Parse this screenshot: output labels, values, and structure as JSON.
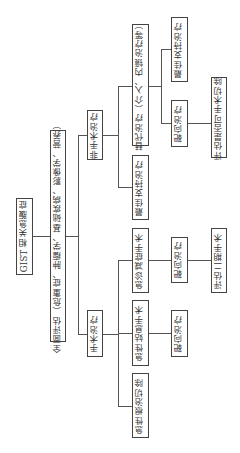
{
  "diagram": {
    "orientation": "rotated-90-ccw",
    "root": "GIST 相关急腹症",
    "assessment": "全面评估（危重症、肿瘤学、基础疾病、影像学、营养）",
    "branches": {
      "non_surgical": {
        "label": "非手术治疗",
        "children": {
          "alternative": "替代治疗（介入、内镜治疗等）",
          "alt_children": {
            "support": "最佳支持治疗",
            "targeted": "靶向治疗"
          },
          "targeted_next": "评估是否可手术切除",
          "support": "最佳支持治疗"
        }
      },
      "surgical": {
        "label": "手术治疗",
        "children": {
          "emergency_relief": "急诊减症手术",
          "emergency_relief_next": "靶向治疗",
          "emergency_relief_final": "评估二期手术",
          "palliative": "急性姑息手术",
          "palliative_next": "靶向治疗",
          "radical": "急性根治切除"
        }
      }
    }
  }
}
